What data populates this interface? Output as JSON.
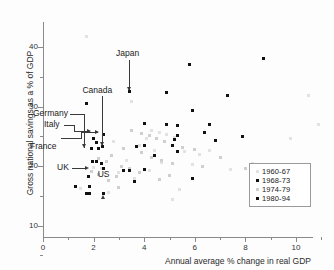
{
  "chart_data": {
    "type": "scatter",
    "title": "",
    "xlabel": "Annual average % change in real GDP",
    "ylabel": "Gross national savings as a % of GDP",
    "xlim": [
      0,
      11
    ],
    "ylim": [
      0,
      44
    ],
    "xticks": [
      0,
      2,
      4,
      6,
      8,
      10
    ],
    "yticks": [
      10,
      20,
      30,
      40
    ],
    "xtick_labels": [
      "0",
      "2",
      "4",
      "6",
      "8",
      "10"
    ],
    "ytick_labels": [
      "10",
      "20",
      "30",
      "40"
    ],
    "grid": false,
    "legend_position": "lower-right",
    "legend": [
      {
        "label": "1960-67",
        "color": "#e2e2e2",
        "marker": "square"
      },
      {
        "label": "1968-73",
        "color": "#111111",
        "marker": "square"
      },
      {
        "label": "1974-79",
        "color": "#cfcfcf",
        "marker": "square"
      },
      {
        "label": "1980-94",
        "color": "#111111",
        "marker": "square"
      }
    ],
    "annotations": [
      {
        "text": "Japan",
        "x": 3.4,
        "y": 32.5
      },
      {
        "text": "Canada",
        "x": 2.35,
        "y": 23.2
      },
      {
        "text": "Germany",
        "x": 2.05,
        "y": 22.9
      },
      {
        "text": "Italy",
        "x": 1.95,
        "y": 20.8
      },
      {
        "text": "France",
        "x": 2.25,
        "y": 20.5
      },
      {
        "text": "UK",
        "x": 1.85,
        "y": 15.3
      },
      {
        "text": "US",
        "x": 2.4,
        "y": 15.4
      }
    ],
    "series": [
      {
        "name": "1960-67",
        "color": "#e2e2e2",
        "points": [
          [
            1.7,
            41.7
          ],
          [
            3.5,
            30.8
          ],
          [
            4.3,
            26.0
          ],
          [
            4.6,
            25.7
          ],
          [
            4.9,
            25.3
          ],
          [
            5.2,
            24.8
          ],
          [
            4.1,
            24.6
          ],
          [
            3.8,
            23.5
          ],
          [
            4.4,
            22.6
          ],
          [
            5.6,
            22.4
          ],
          [
            3.3,
            21.0
          ],
          [
            4.7,
            20.6
          ],
          [
            5.9,
            20.2
          ],
          [
            6.6,
            22.6
          ],
          [
            7.4,
            19.4
          ],
          [
            10.5,
            31.9
          ],
          [
            9.8,
            24.6
          ],
          [
            10.9,
            27.0
          ],
          [
            2.0,
            19.8
          ],
          [
            2.3,
            19.5
          ],
          [
            3.0,
            18.9
          ],
          [
            3.6,
            17.9
          ],
          [
            1.5,
            16.2
          ],
          [
            2.6,
            15.5
          ],
          [
            5.1,
            14.3
          ],
          [
            6.2,
            22.0
          ],
          [
            5.4,
            16.0
          ],
          [
            8.3,
            20.5
          ],
          [
            2.8,
            24.2
          ],
          [
            4.2,
            19.2
          ]
        ]
      },
      {
        "name": "1968-73",
        "color": "#111111",
        "points": [
          [
            1.7,
            30.5
          ],
          [
            3.4,
            32.5
          ],
          [
            4.9,
            32.3
          ],
          [
            5.8,
            37.1
          ],
          [
            8.7,
            38.0
          ],
          [
            2.4,
            25.3
          ],
          [
            2.0,
            24.6
          ],
          [
            2.1,
            24.0
          ],
          [
            4.0,
            27.1
          ],
          [
            4.9,
            26.9
          ],
          [
            5.3,
            26.8
          ],
          [
            5.9,
            29.4
          ],
          [
            6.6,
            26.9
          ],
          [
            7.3,
            31.8
          ],
          [
            6.4,
            25.6
          ],
          [
            5.3,
            25.2
          ],
          [
            5.2,
            24.5
          ],
          [
            6.8,
            24.3
          ],
          [
            7.9,
            25.0
          ],
          [
            2.2,
            23.0
          ],
          [
            1.9,
            22.9
          ],
          [
            2.35,
            23.2
          ],
          [
            3.7,
            23.3
          ],
          [
            4.0,
            23.5
          ],
          [
            5.1,
            23.4
          ],
          [
            5.3,
            22.4
          ],
          [
            4.4,
            21.8
          ],
          [
            1.95,
            20.8
          ],
          [
            2.1,
            20.7
          ],
          [
            2.3,
            20.4
          ],
          [
            2.4,
            19.5
          ],
          [
            3.2,
            19.2
          ],
          [
            3.4,
            19.2
          ],
          [
            4.0,
            19.4
          ],
          [
            5.9,
            17.9
          ],
          [
            3.6,
            17.4
          ],
          [
            1.8,
            18.2
          ],
          [
            1.3,
            16.5
          ],
          [
            1.85,
            16.6
          ],
          [
            1.7,
            15.3
          ],
          [
            1.85,
            15.3
          ],
          [
            2.4,
            15.4
          ]
        ]
      },
      {
        "name": "1974-79",
        "color": "#cfcfcf",
        "points": [
          [
            3.5,
            26.0
          ],
          [
            3.9,
            25.5
          ],
          [
            4.2,
            25.1
          ],
          [
            4.5,
            24.7
          ],
          [
            4.8,
            24.2
          ],
          [
            3.2,
            23.0
          ],
          [
            3.9,
            22.2
          ],
          [
            4.3,
            21.4
          ],
          [
            4.7,
            21.0
          ],
          [
            5.1,
            20.4
          ],
          [
            2.7,
            21.8
          ],
          [
            3.1,
            20.0
          ],
          [
            3.4,
            19.6
          ],
          [
            3.8,
            18.9
          ],
          [
            2.9,
            18.2
          ],
          [
            2.5,
            20.8
          ],
          [
            2.2,
            21.2
          ],
          [
            5.5,
            23.1
          ],
          [
            6.0,
            22.8
          ],
          [
            6.3,
            20.0
          ],
          [
            7.0,
            21.5
          ],
          [
            8.0,
            19.6
          ],
          [
            2.6,
            17.6
          ],
          [
            3.0,
            16.4
          ],
          [
            4.6,
            17.8
          ],
          [
            5.0,
            18.4
          ],
          [
            1.9,
            19.0
          ],
          [
            2.2,
            18.6
          ]
        ]
      }
    ]
  },
  "figure": {
    "background": "#fdfdfd",
    "axis_color": "#8a8a8a",
    "text_color": "#2b2b2b"
  }
}
